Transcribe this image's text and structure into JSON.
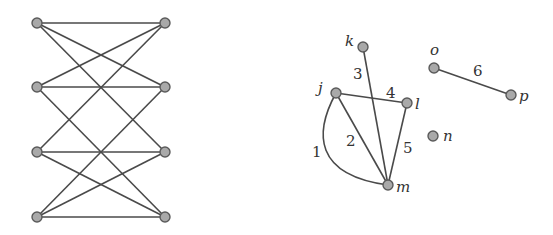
{
  "left_graph": {
    "nodes": [
      {
        "id": "L1",
        "x": 37,
        "y": 23
      },
      {
        "id": "L2",
        "x": 37,
        "y": 87
      },
      {
        "id": "L3",
        "x": 37,
        "y": 152
      },
      {
        "id": "L4",
        "x": 37,
        "y": 217
      },
      {
        "id": "R1",
        "x": 165,
        "y": 23
      },
      {
        "id": "R2",
        "x": 165,
        "y": 87
      },
      {
        "id": "R3",
        "x": 165,
        "y": 152
      },
      {
        "id": "R4",
        "x": 165,
        "y": 217
      }
    ],
    "edges": [
      [
        "L1",
        "R1"
      ],
      [
        "L1",
        "R2"
      ],
      [
        "L1",
        "R3"
      ],
      [
        "L2",
        "R1"
      ],
      [
        "L2",
        "R2"
      ],
      [
        "L2",
        "R4"
      ],
      [
        "L3",
        "R1"
      ],
      [
        "L3",
        "R3"
      ],
      [
        "L3",
        "R4"
      ],
      [
        "L4",
        "R2"
      ],
      [
        "L4",
        "R3"
      ],
      [
        "L4",
        "R4"
      ]
    ]
  },
  "right_graph": {
    "nodes": [
      {
        "id": "k",
        "label": "k",
        "x": 363,
        "y": 47,
        "lx": 345,
        "ly": 46
      },
      {
        "id": "j",
        "label": "j",
        "x": 336,
        "y": 93,
        "lx": 318,
        "ly": 93
      },
      {
        "id": "l",
        "label": "l",
        "x": 407,
        "y": 103,
        "lx": 415,
        "ly": 109
      },
      {
        "id": "m",
        "label": "m",
        "x": 388,
        "y": 185,
        "lx": 396,
        "ly": 192
      },
      {
        "id": "n",
        "label": "n",
        "x": 433,
        "y": 136,
        "lx": 443,
        "ly": 141
      },
      {
        "id": "o",
        "label": "o",
        "x": 434,
        "y": 68,
        "lx": 430,
        "ly": 55
      },
      {
        "id": "p",
        "label": "p",
        "x": 511,
        "y": 95,
        "lx": 519,
        "ly": 101
      }
    ],
    "edges": [
      {
        "from": "j",
        "to": "m",
        "label": "1",
        "curved": true,
        "lx": 312,
        "ly": 157
      },
      {
        "from": "j",
        "to": "m",
        "label": "2",
        "curved": false,
        "lx": 346,
        "ly": 146
      },
      {
        "from": "k",
        "to": "m",
        "label": "3",
        "lx": 353,
        "ly": 79
      },
      {
        "from": "j",
        "to": "l",
        "label": "4",
        "lx": 386,
        "ly": 98
      },
      {
        "from": "l",
        "to": "m",
        "label": "5",
        "lx": 403,
        "ly": 153
      },
      {
        "from": "o",
        "to": "p",
        "label": "6",
        "lx": 473,
        "ly": 76
      }
    ]
  }
}
